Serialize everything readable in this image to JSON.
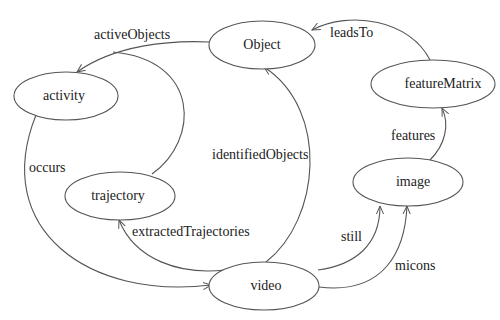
{
  "diagram": {
    "type": "directed-graph",
    "nodes": [
      {
        "id": "Object",
        "label": "Object"
      },
      {
        "id": "activity",
        "label": "activity"
      },
      {
        "id": "featureMatrix",
        "label": "featureMatrix"
      },
      {
        "id": "trajectory",
        "label": "trajectory"
      },
      {
        "id": "image",
        "label": "image"
      },
      {
        "id": "video",
        "label": "video"
      }
    ],
    "edges": [
      {
        "from": "Object",
        "to": "activity",
        "label": "activeObjects"
      },
      {
        "from": "trajectory",
        "to": "activity",
        "label": ""
      },
      {
        "from": "featureMatrix",
        "to": "Object",
        "label": "leadsTo"
      },
      {
        "from": "image",
        "to": "featureMatrix",
        "label": "features"
      },
      {
        "from": "activity",
        "to": "video",
        "label": "occurs"
      },
      {
        "from": "video",
        "to": "Object",
        "label": "identifiedObjects"
      },
      {
        "from": "video",
        "to": "trajectory",
        "label": "extractedTrajectories"
      },
      {
        "from": "video",
        "to": "image",
        "label": "still"
      },
      {
        "from": "video",
        "to": "image",
        "label": "micons"
      }
    ]
  },
  "colors": {
    "stroke": "#555555",
    "text": "#222222",
    "background": "#ffffff"
  }
}
